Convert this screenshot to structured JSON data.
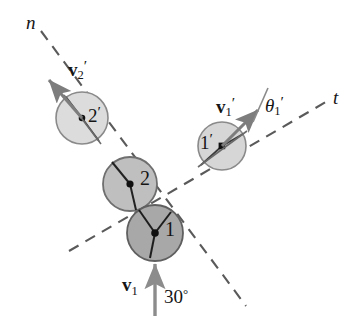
{
  "figure": {
    "background_color": "#ffffff",
    "ink_color": "#151515",
    "dash_color": "#5a5a5a",
    "arrow_color": "#7d7d7d"
  },
  "axes": [
    {
      "name": "n-axis",
      "label": "n",
      "style": "dashed",
      "x1": 41,
      "y1": 31,
      "x2": 246,
      "y2": 306,
      "label_x": 26,
      "label_y": 13
    },
    {
      "name": "t-axis",
      "label": "t",
      "style": "dashed",
      "x1": 69,
      "y1": 251,
      "x2": 331,
      "y2": 99,
      "label_x": 333,
      "label_y": 88
    }
  ],
  "circles": [
    {
      "name": "ball-2-prime",
      "label": "2",
      "prime": "′",
      "cx": 82,
      "cy": 118,
      "r": 26,
      "fill": "#dcdcdc",
      "stroke": "#8a8a8a",
      "state": "after-impact"
    },
    {
      "name": "ball-1-prime",
      "label": "1",
      "prime": "′",
      "cx": 222,
      "cy": 146,
      "r": 24,
      "fill": "#d6d6d6",
      "stroke": "#8a8a8a",
      "state": "after-impact"
    },
    {
      "name": "ball-2",
      "label": "2",
      "prime": "",
      "cx": 130,
      "cy": 184,
      "r": 27,
      "fill": "#bfbfbf",
      "stroke": "#6f6f6f",
      "state": "at-impact"
    },
    {
      "name": "ball-1",
      "label": "1",
      "prime": "",
      "cx": 155,
      "cy": 233,
      "r": 28,
      "fill": "#a8a8a8",
      "stroke": "#5f5f5f",
      "state": "at-impact"
    }
  ],
  "vectors": [
    {
      "name": "velocity-2-prime",
      "label": "v",
      "subscript": "2",
      "prime": "′",
      "x1": 82,
      "y1": 118,
      "x2": 47,
      "y2": 78,
      "color": "#7d7d7d",
      "label_x": 68,
      "label_y": 58
    },
    {
      "name": "velocity-1-prime",
      "label": "v",
      "subscript": "1",
      "prime": "′",
      "x1": 222,
      "y1": 146,
      "x2": 260,
      "y2": 108,
      "color": "#7d7d7d",
      "label_x": 216,
      "label_y": 95
    },
    {
      "name": "velocity-1-initial",
      "label": "v",
      "subscript": "1",
      "prime": "",
      "x1": 155,
      "y1": 315,
      "x2": 155,
      "y2": 263,
      "color": "#7d7d7d",
      "label_x": 122,
      "label_y": 275
    }
  ],
  "angles": [
    {
      "name": "theta-1-prime",
      "label": "θ",
      "subscript": "1",
      "prime": "′",
      "value_text": "",
      "label_x": 265,
      "label_y": 94
    },
    {
      "name": "impact-angle-30",
      "label": "30",
      "unit": "°",
      "value_text": "30°",
      "label_x": 164,
      "label_y": 287
    }
  ],
  "labels": {
    "n_axis": "n",
    "t_axis": "t",
    "ball_2_prime": "2",
    "ball_1_prime": "1",
    "ball_2": "2",
    "ball_1": "1",
    "v": "v",
    "theta": "θ",
    "prime_mark": "′",
    "sub_1": "1",
    "sub_2": "2",
    "angle_30": "30",
    "degree_sign": "°"
  }
}
